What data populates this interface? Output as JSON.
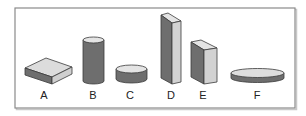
{
  "figure": {
    "frame": {
      "stroke": "#8a8a8a"
    },
    "colors": {
      "light_face": "#d6d6d6",
      "top_face": "#e4e4e4",
      "dark_face": "#6e6e6e",
      "outline": "#3a3a3a"
    },
    "shapes": [
      {
        "id": "A",
        "label": "A",
        "type": "flat-rectangular-block"
      },
      {
        "id": "B",
        "label": "B",
        "type": "tall-cylinder"
      },
      {
        "id": "C",
        "label": "C",
        "type": "short-cylinder"
      },
      {
        "id": "D",
        "label": "D",
        "type": "tall-rectangular-prism"
      },
      {
        "id": "E",
        "label": "E",
        "type": "medium-rectangular-prism"
      },
      {
        "id": "F",
        "label": "F",
        "type": "flat-disc"
      }
    ]
  }
}
